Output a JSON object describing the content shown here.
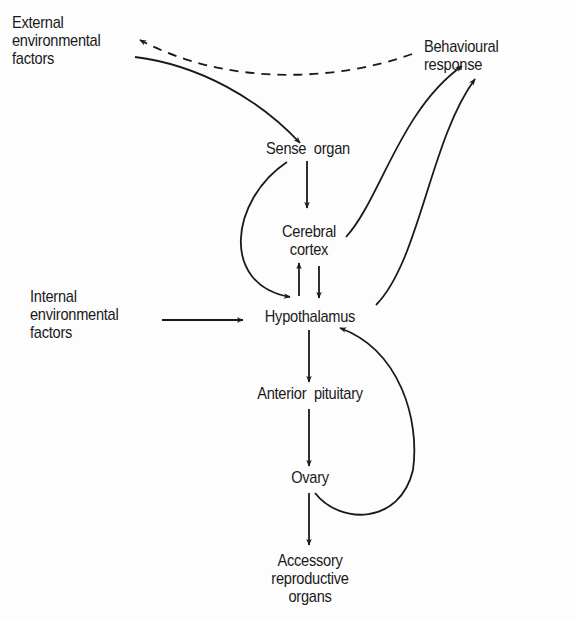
{
  "diagram": {
    "type": "flow-diagram",
    "nodes": {
      "external": {
        "lines": [
          "External",
          "environmental",
          "factors"
        ]
      },
      "behavioural": {
        "lines": [
          "Behavioural",
          "response"
        ]
      },
      "sense": {
        "label": "Sense  organ"
      },
      "cortex": {
        "lines": [
          "Cerebral",
          "cortex"
        ]
      },
      "internal": {
        "lines": [
          "Internal",
          "environmental",
          "factors"
        ]
      },
      "hypothalamus": {
        "label": "Hypothalamus"
      },
      "pituitary": {
        "label": "Anterior  pituitary"
      },
      "ovary": {
        "label": "Ovary"
      },
      "accessory": {
        "lines": [
          "Accessory",
          "reproductive",
          "organs"
        ]
      }
    },
    "edges": [
      {
        "from": "External environmental factors",
        "to": "Sense organ",
        "style": "solid"
      },
      {
        "from": "Behavioural response",
        "to": "External environmental factors",
        "style": "dashed"
      },
      {
        "from": "Sense organ",
        "to": "Cerebral cortex",
        "style": "solid"
      },
      {
        "from": "Sense organ",
        "to": "Hypothalamus",
        "style": "solid"
      },
      {
        "from": "Cerebral cortex",
        "to": "Hypothalamus",
        "style": "solid"
      },
      {
        "from": "Hypothalamus",
        "to": "Cerebral cortex",
        "style": "solid"
      },
      {
        "from": "Cerebral cortex",
        "to": "Behavioural response",
        "style": "solid"
      },
      {
        "from": "Hypothalamus",
        "to": "Behavioural response",
        "style": "solid"
      },
      {
        "from": "Internal environmental factors",
        "to": "Hypothalamus",
        "style": "solid"
      },
      {
        "from": "Hypothalamus",
        "to": "Anterior pituitary",
        "style": "solid"
      },
      {
        "from": "Anterior pituitary",
        "to": "Ovary",
        "style": "solid"
      },
      {
        "from": "Ovary",
        "to": "Hypothalamus",
        "style": "solid"
      },
      {
        "from": "Ovary",
        "to": "Accessory reproductive organs",
        "style": "solid"
      }
    ],
    "colors": {
      "ink": "#1a1a1a",
      "background": "#fdfdfd"
    }
  }
}
